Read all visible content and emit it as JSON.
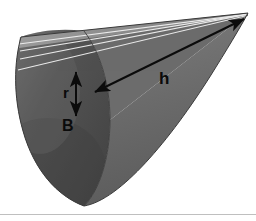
{
  "figure": {
    "kind": "cone-geometry-diagram",
    "width": 256,
    "height": 221,
    "background_color": "#ffffff",
    "baseline_color": "#bfbfbf"
  },
  "labels": {
    "height": "h",
    "radius": "r",
    "base": "B"
  },
  "colors": {
    "cone_body_light": "#6e6e6e",
    "cone_body_mid": "#636363",
    "cone_body_dark": "#4d4d4d",
    "base_ellipse": "#555555",
    "base_ellipse_shadow": "#464646",
    "top_highlight": "#8a8a8a",
    "streak_line": "#f2f2f2",
    "annotation_stroke": "#0b0b0b",
    "outline": "#2b2b2b"
  },
  "geometry": {
    "apex": {
      "x": 248,
      "y": 13
    },
    "base_center": {
      "x": 86,
      "y": 112
    },
    "base_rx": 36,
    "base_ry": 86,
    "base_rotation_deg": -14,
    "streak_line_count": 4
  },
  "annotations": {
    "height_arrow": {
      "name": "h",
      "from": {
        "x": 94,
        "y": 92
      },
      "to": {
        "x": 245,
        "y": 19
      },
      "double_headed": true
    },
    "radius_arrow": {
      "name": "r",
      "from": {
        "x": 76,
        "y": 72
      },
      "to": {
        "x": 76,
        "y": 116
      },
      "double_headed": true
    }
  }
}
